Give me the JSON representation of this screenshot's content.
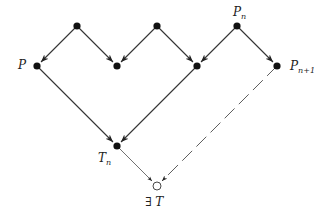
{
  "diagram": {
    "type": "directed graph (zigzag lattice)",
    "nodes": [
      {
        "id": "top1",
        "x": 77,
        "y": 26,
        "filled": true,
        "label": ""
      },
      {
        "id": "top2",
        "x": 157,
        "y": 26,
        "filled": true,
        "label": ""
      },
      {
        "id": "pn",
        "x": 237,
        "y": 26,
        "filled": true,
        "label": "P",
        "sub": "n"
      },
      {
        "id": "p",
        "x": 37,
        "y": 66,
        "filled": true,
        "label": "P",
        "sub": ""
      },
      {
        "id": "mid1",
        "x": 117,
        "y": 66,
        "filled": true,
        "label": ""
      },
      {
        "id": "mid2",
        "x": 197,
        "y": 66,
        "filled": true,
        "label": ""
      },
      {
        "id": "pn1",
        "x": 277,
        "y": 66,
        "filled": true,
        "label": "P",
        "sub": "n+1"
      },
      {
        "id": "tn",
        "x": 117,
        "y": 146,
        "filled": true,
        "label": "T",
        "sub": "n"
      },
      {
        "id": "t",
        "x": 157,
        "y": 186,
        "filled": false,
        "label": "∃ T",
        "sub": ""
      }
    ],
    "edges": [
      {
        "from": "top1",
        "to": "p",
        "style": "solid"
      },
      {
        "from": "top1",
        "to": "mid1",
        "style": "solid"
      },
      {
        "from": "top2",
        "to": "mid1",
        "style": "solid"
      },
      {
        "from": "top2",
        "to": "mid2",
        "style": "solid"
      },
      {
        "from": "pn",
        "to": "mid2",
        "style": "solid"
      },
      {
        "from": "pn",
        "to": "pn1",
        "style": "solid"
      },
      {
        "from": "p",
        "to": "tn",
        "style": "solid"
      },
      {
        "from": "mid2",
        "to": "tn",
        "style": "solid"
      },
      {
        "from": "tn",
        "to": "t",
        "style": "thin"
      },
      {
        "from": "pn1",
        "to": "t",
        "style": "dashed"
      }
    ]
  },
  "labels": {
    "p": "P",
    "pn_main": "P",
    "pn_sub": "n",
    "pn1_main": "P",
    "pn1_sub": "n+1",
    "tn_main": "T",
    "tn_sub": "n",
    "exists_t": "∃ T"
  }
}
